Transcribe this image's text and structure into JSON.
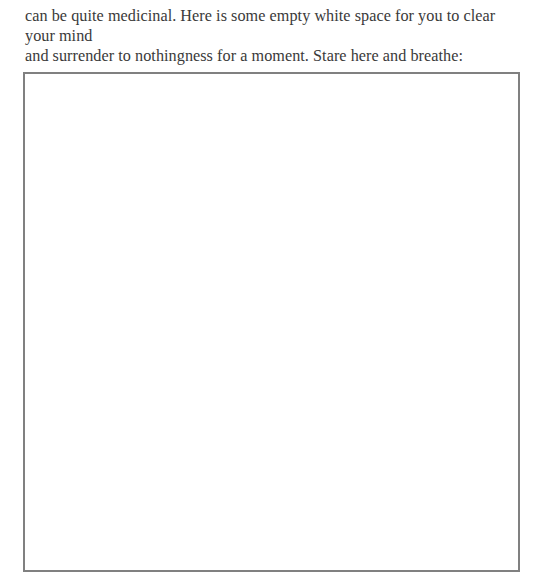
{
  "document": {
    "paragraph_lines": [
      "can be quite medicinal. Here is some empty white space for you to clear your mind",
      "and surrender to nothingness for a moment. Stare here and breathe:"
    ]
  },
  "box": {
    "border_color": "#808080",
    "fill_color": "#ffffff"
  }
}
